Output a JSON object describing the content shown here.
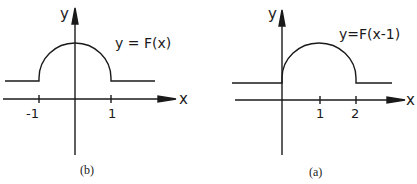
{
  "panels": [
    {
      "id": "b",
      "caption": "(b)",
      "function_label": "y = F(x)",
      "x_axis_label": "x",
      "y_axis_label": "y",
      "ticks": [
        "-1",
        "1"
      ]
    },
    {
      "id": "a",
      "caption": "(a)",
      "function_label": "y=F(x-1)",
      "x_axis_label": "x",
      "y_axis_label": "y",
      "ticks": [
        "1",
        "2"
      ]
    }
  ],
  "colors": {
    "ink": "#1a1a1a",
    "background": "#ffffff"
  }
}
